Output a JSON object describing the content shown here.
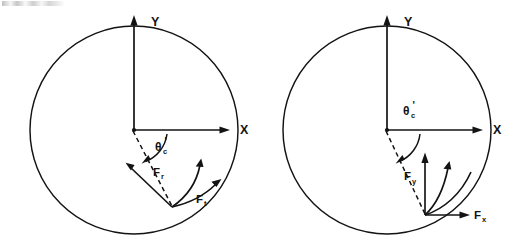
{
  "figure": {
    "background_color": "#ffffff",
    "ink_color": "#131313",
    "caption_fragment": "",
    "panel_count": 2
  },
  "panels": [
    {
      "id": "left-panel",
      "name": "force-decomposition-tilted",
      "axes": {
        "x_label": "X",
        "y_label": "Y"
      },
      "angle": {
        "symbol": "θ",
        "subscript": "c",
        "prime": "'",
        "full": "θ'c",
        "position": "below-x-axis"
      },
      "forces": [
        {
          "label": "F",
          "subscript": "r",
          "full": "Fᵣ",
          "name": "radial-force",
          "direction": "up-left-inward"
        },
        {
          "label": "F",
          "subscript": "t",
          "full": "Fₜ",
          "name": "tangential-force",
          "direction": "up-right-outward"
        }
      ],
      "circle": {
        "center_x": 134,
        "center_y": 130,
        "radius": 104
      },
      "application_point": {
        "x": 172,
        "y": 207
      }
    },
    {
      "id": "right-panel",
      "name": "force-decomposition-cartesian",
      "axes": {
        "x_label": "X",
        "y_label": "Y"
      },
      "angle": {
        "symbol": "θ",
        "subscript": "c",
        "prime": "'",
        "full": "θ'c",
        "position": "above-x-axis"
      },
      "forces": [
        {
          "label": "F",
          "subscript": "y",
          "full": "Fᵧ",
          "name": "vertical-force",
          "direction": "up"
        },
        {
          "label": "F",
          "subscript": "x",
          "full": "Fₓ",
          "name": "horizontal-force",
          "direction": "right"
        }
      ],
      "circle": {
        "center_x": 387,
        "center_y": 130,
        "radius": 104
      },
      "application_point": {
        "x": 425,
        "y": 215
      }
    }
  ]
}
